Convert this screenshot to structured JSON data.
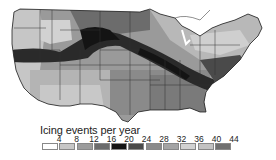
{
  "legend": {
    "title": "Icing events per year",
    "ticks": [
      "4",
      "8",
      "12",
      "16",
      "20",
      "24",
      "28",
      "32",
      "36",
      "40",
      "44"
    ],
    "colors": [
      "#ffffff",
      "#c6c6c6",
      "#9c9c9c",
      "#6c6c6c",
      "#141414",
      "#4a4a4a",
      "#8a8a8a",
      "#a4a4a4",
      "#d2d2d2",
      "#c2c2c2",
      "#707070"
    ]
  },
  "map": {
    "region": "Contiguous United States",
    "subject": "Icing events per year"
  }
}
